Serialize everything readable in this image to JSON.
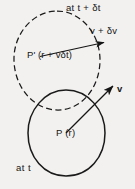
{
  "figure": {
    "background_color": "#f2f1ef",
    "stroke_color": "#1a1a1a",
    "text_color": "#161616"
  },
  "labels": {
    "at_t_plus_dt": "at  t + δt",
    "v_plus_dv": "v + δv",
    "p_prime_position": "P' (r + vδt)",
    "v": "v",
    "p_position": "P (r)",
    "at_t": "at  t"
  },
  "shapes": {
    "dashed_blob": {
      "name": "fluid-element-at-t-plus-dt",
      "style": "dashed",
      "cx": 57,
      "cy": 61,
      "rx": 43,
      "ry": 50
    },
    "solid_blob": {
      "name": "fluid-element-at-t",
      "style": "solid",
      "cx": 66,
      "cy": 133,
      "rx": 39,
      "ry": 43
    }
  },
  "vectors": {
    "upper": {
      "name": "velocity-vector-at-t-plus-dt",
      "from": [
        40,
        56
      ],
      "to": [
        113,
        42
      ],
      "label": "v + δv"
    },
    "lower": {
      "name": "velocity-vector-at-t",
      "from": [
        66,
        133
      ],
      "to": [
        122,
        78
      ],
      "label": "v"
    }
  }
}
